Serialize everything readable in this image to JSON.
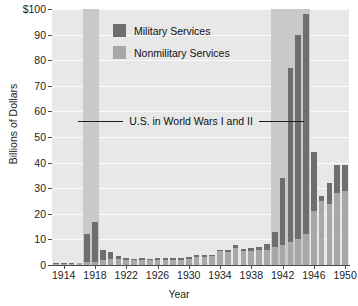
{
  "chart_data": {
    "type": "bar",
    "title": "",
    "xlabel": "Year",
    "ylabel": "Billions of Dollars",
    "ylim": [
      0,
      100
    ],
    "ytick_labels": [
      "$100",
      "90",
      "80",
      "70",
      "60",
      "50",
      "40",
      "30",
      "20",
      "10",
      "0"
    ],
    "ytick_values": [
      100,
      90,
      80,
      70,
      60,
      50,
      40,
      30,
      20,
      10,
      0
    ],
    "xtick_labels": [
      "1914",
      "1918",
      "1922",
      "1926",
      "1930",
      "1934",
      "1938",
      "1942",
      "1946",
      "1950"
    ],
    "xtick_values": [
      1914,
      1918,
      1922,
      1926,
      1930,
      1934,
      1938,
      1942,
      1946,
      1950
    ],
    "grid": true,
    "legend_position": "upper-left-inside",
    "stacked": true,
    "categories": [
      1913,
      1914,
      1915,
      1916,
      1917,
      1918,
      1919,
      1920,
      1921,
      1922,
      1923,
      1924,
      1925,
      1926,
      1927,
      1928,
      1929,
      1930,
      1931,
      1932,
      1933,
      1934,
      1935,
      1936,
      1937,
      1938,
      1939,
      1940,
      1941,
      1942,
      1943,
      1944,
      1945,
      1946,
      1947,
      1948,
      1949,
      1950
    ],
    "series": [
      {
        "name": "Nonmilitary Services",
        "color": "#a8a8a8",
        "values": [
          0.5,
          0.5,
          0.5,
          0.6,
          1.0,
          1.2,
          2.0,
          2.5,
          2.3,
          1.9,
          1.8,
          1.9,
          1.8,
          1.9,
          1.9,
          1.9,
          2.1,
          2.5,
          3.2,
          3.2,
          3.4,
          5.3,
          5.2,
          6.8,
          5.5,
          5.6,
          6.0,
          6.0,
          7.0,
          8.0,
          9.0,
          10.0,
          12.0,
          21.0,
          25.0,
          24.0,
          28.0,
          29.0
        ]
      },
      {
        "name": "Military Services",
        "color": "#6e6e6e",
        "values": [
          0.2,
          0.2,
          0.2,
          0.2,
          11.0,
          15.5,
          4.0,
          2.4,
          1.1,
          0.8,
          0.7,
          0.7,
          0.7,
          0.7,
          0.7,
          0.8,
          0.8,
          0.8,
          0.7,
          0.7,
          0.6,
          0.7,
          0.8,
          0.9,
          0.9,
          1.0,
          1.2,
          2.2,
          6.0,
          26.0,
          68.0,
          80.0,
          86.0,
          23.0,
          2.0,
          8.0,
          11.0,
          10.0
        ]
      }
    ],
    "shaded_regions": [
      {
        "label": "World War I",
        "start": 1917,
        "end": 1918
      },
      {
        "label": "World War II",
        "start": 1941,
        "end": 1945
      }
    ],
    "annotation": "U.S. in World Wars I and II"
  },
  "legend": {
    "items": [
      {
        "label": "Military Services",
        "color": "#6e6e6e"
      },
      {
        "label": "Nonmilitary Services",
        "color": "#a8a8a8"
      }
    ]
  }
}
